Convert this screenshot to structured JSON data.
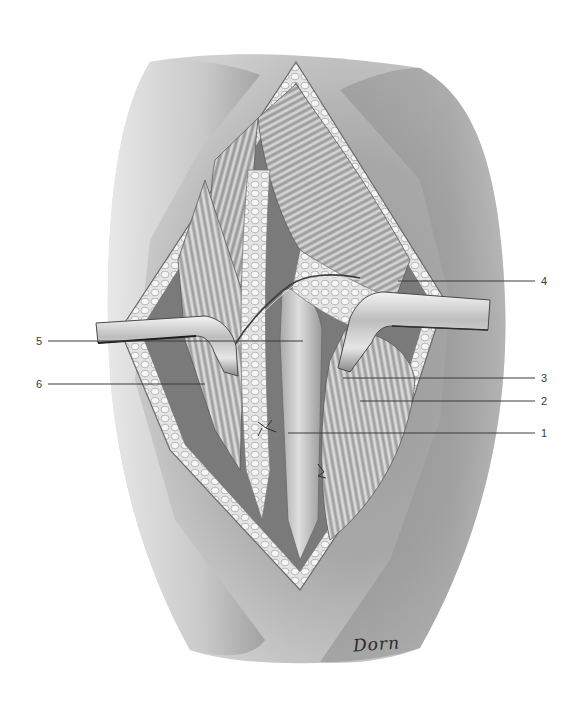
{
  "figure": {
    "type": "anatomical surgical illustration",
    "style": "graphite pencil, grayscale",
    "signature": "Dorn"
  },
  "callouts": [
    {
      "number": "1",
      "side": "right",
      "label_x": 541,
      "label_y": 433,
      "line": {
        "x1": 288,
        "y1": 433,
        "x2": 535,
        "y2": 433
      }
    },
    {
      "number": "2",
      "side": "right",
      "label_x": 541,
      "label_y": 401,
      "line": {
        "x1": 360,
        "y1": 401,
        "x2": 535,
        "y2": 401
      }
    },
    {
      "number": "3",
      "side": "right",
      "label_x": 541,
      "label_y": 378,
      "line": {
        "x1": 343,
        "y1": 378,
        "x2": 535,
        "y2": 378
      }
    },
    {
      "number": "4",
      "side": "right",
      "label_x": 541,
      "label_y": 281,
      "line": {
        "x1": 398,
        "y1": 281,
        "x2": 535,
        "y2": 281
      }
    },
    {
      "number": "5",
      "side": "left",
      "label_x": 36,
      "label_y": 341,
      "line": {
        "x1": 48,
        "y1": 341,
        "x2": 303,
        "y2": 341
      }
    },
    {
      "number": "6",
      "side": "left",
      "label_x": 36,
      "label_y": 384,
      "line": {
        "x1": 48,
        "y1": 384,
        "x2": 205,
        "y2": 384
      }
    }
  ],
  "colors": {
    "background": "#ffffff",
    "skin_dark": "#8a8a8a",
    "skin_light": "#e2e2e2",
    "fat": "#d8d8d8",
    "muscle": "#b0b0b0",
    "retractor": "#c8c8c8",
    "leader_line": "#3a3a3a"
  }
}
